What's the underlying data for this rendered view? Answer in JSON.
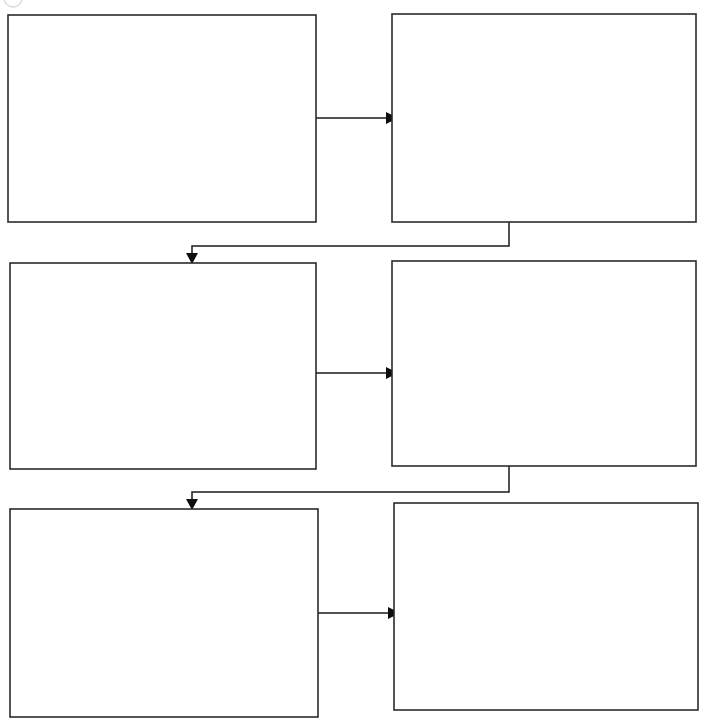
{
  "document": {
    "title": "Flowchart",
    "background_color": "#ffffff",
    "width": 708,
    "height": 724
  },
  "style": {
    "box_stroke_color": "#2b2b2b",
    "box_fill_color": "#ffffff",
    "connector_color": "#1a1a1a",
    "arrowhead_color": "#0d0d0d",
    "corner_mark_color": "#d8d8d8"
  },
  "diagram": {
    "type": "flowchart",
    "layout": "3-rows-by-2-columns-serpentine",
    "nodes": [
      {
        "id": "box-1",
        "label": "",
        "row": 1,
        "column": 1,
        "x": 8,
        "y": 15,
        "width": 308,
        "height": 207
      },
      {
        "id": "box-2",
        "label": "",
        "row": 1,
        "column": 2,
        "x": 392,
        "y": 14,
        "width": 304,
        "height": 208
      },
      {
        "id": "box-3",
        "label": "",
        "row": 2,
        "column": 1,
        "x": 10,
        "y": 263,
        "width": 306,
        "height": 206
      },
      {
        "id": "box-4",
        "label": "",
        "row": 2,
        "column": 2,
        "x": 392,
        "y": 261,
        "width": 304,
        "height": 205
      },
      {
        "id": "box-5",
        "label": "",
        "row": 3,
        "column": 1,
        "x": 10,
        "y": 509,
        "width": 308,
        "height": 208
      },
      {
        "id": "box-6",
        "label": "",
        "row": 3,
        "column": 2,
        "x": 394,
        "y": 503,
        "width": 304,
        "height": 207
      }
    ],
    "connectors": [
      {
        "id": "connector-1-to-2",
        "from": "box-1",
        "to": "box-2",
        "label": "",
        "kind": "straight-horizontal",
        "direction": "right"
      },
      {
        "id": "connector-2-to-3",
        "from": "box-2",
        "to": "box-3",
        "label": "",
        "kind": "elbow-down-left",
        "direction": "down"
      },
      {
        "id": "connector-3-to-4",
        "from": "box-3",
        "to": "box-4",
        "label": "",
        "kind": "straight-horizontal",
        "direction": "right"
      },
      {
        "id": "connector-4-to-5",
        "from": "box-4",
        "to": "box-5",
        "label": "",
        "kind": "elbow-down-left",
        "direction": "down"
      },
      {
        "id": "connector-5-to-6",
        "from": "box-5",
        "to": "box-6",
        "label": "",
        "kind": "straight-horizontal",
        "direction": "right"
      }
    ],
    "corner_mark": {
      "id": "corner-arc-mark",
      "description": "faint clipped gray arc at top-left edge",
      "x": 4,
      "y": -6,
      "radius": 9
    }
  }
}
